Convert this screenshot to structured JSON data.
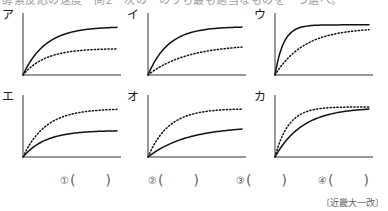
{
  "header": {
    "clipped_text": "酵素反応の速度　問2　次の　のうち最も適当なものを一つ選べ。"
  },
  "panels": [
    {
      "label": "ア",
      "curves": [
        {
          "style": "solid",
          "plateau": 0.82,
          "rate": 4.2
        },
        {
          "style": "dotted",
          "plateau": 0.45,
          "rate": 4.2
        }
      ]
    },
    {
      "label": "イ",
      "curves": [
        {
          "style": "solid",
          "plateau": 0.82,
          "rate": 4.6
        },
        {
          "style": "dotted",
          "plateau": 0.52,
          "rate": 2.4
        }
      ]
    },
    {
      "label": "ウ",
      "curves": [
        {
          "style": "solid",
          "plateau": 0.85,
          "rate": 11.0
        },
        {
          "style": "dotted",
          "plateau": 0.8,
          "rate": 3.2
        }
      ]
    },
    {
      "label": "エ",
      "curves": [
        {
          "style": "dotted",
          "plateau": 0.82,
          "rate": 4.2
        },
        {
          "style": "solid",
          "plateau": 0.45,
          "rate": 4.2
        }
      ]
    },
    {
      "label": "オ",
      "curves": [
        {
          "style": "dotted",
          "plateau": 0.82,
          "rate": 4.6
        },
        {
          "style": "solid",
          "plateau": 0.52,
          "rate": 2.4
        }
      ]
    },
    {
      "label": "カ",
      "curves": [
        {
          "style": "dotted",
          "plateau": 0.85,
          "rate": 7.0
        },
        {
          "style": "solid",
          "plateau": 0.84,
          "rate": 3.4
        }
      ]
    }
  ],
  "answers": [
    {
      "number": "①",
      "open": "(",
      "value": "",
      "close": ")"
    },
    {
      "number": "②",
      "open": "(",
      "value": "",
      "close": ")"
    },
    {
      "number": "③",
      "open": "(",
      "value": "",
      "close": ")"
    },
    {
      "number": "④",
      "open": "(",
      "value": "",
      "close": ")"
    }
  ],
  "attribution": "〔近畿大一改〕",
  "chart_data": {
    "type": "line",
    "title": "",
    "xlabel": "",
    "ylabel": "",
    "grid": false,
    "legend": "none",
    "axis_ranges": {
      "xlim": [
        0,
        1
      ],
      "ylim": [
        0,
        1
      ]
    },
    "panel_count": 6,
    "note": "Six small saturation-curve plots (Michaelis-Menten style). Each panel shows one solid and one dotted curve rising from the origin to a plateau. No tick labels or gridlines are printed.",
    "panels": [
      {
        "label": "ア",
        "series": [
          {
            "name": "solid",
            "style": "solid",
            "plateau": 0.82,
            "rate": 4.2
          },
          {
            "name": "dotted",
            "style": "dotted",
            "plateau": 0.45,
            "rate": 4.2
          }
        ]
      },
      {
        "label": "イ",
        "series": [
          {
            "name": "solid",
            "style": "solid",
            "plateau": 0.82,
            "rate": 4.6
          },
          {
            "name": "dotted",
            "style": "dotted",
            "plateau": 0.52,
            "rate": 2.4
          }
        ]
      },
      {
        "label": "ウ",
        "series": [
          {
            "name": "solid",
            "style": "solid",
            "plateau": 0.85,
            "rate": 11.0
          },
          {
            "name": "dotted",
            "style": "dotted",
            "plateau": 0.8,
            "rate": 3.2
          }
        ]
      },
      {
        "label": "エ",
        "series": [
          {
            "name": "dotted",
            "style": "dotted",
            "plateau": 0.82,
            "rate": 4.2
          },
          {
            "name": "solid",
            "style": "solid",
            "plateau": 0.45,
            "rate": 4.2
          }
        ]
      },
      {
        "label": "オ",
        "series": [
          {
            "name": "dotted",
            "style": "dotted",
            "plateau": 0.82,
            "rate": 4.6
          },
          {
            "name": "solid",
            "style": "solid",
            "plateau": 0.52,
            "rate": 2.4
          }
        ]
      },
      {
        "label": "カ",
        "series": [
          {
            "name": "dotted",
            "style": "dotted",
            "plateau": 0.85,
            "rate": 7.0
          },
          {
            "name": "solid",
            "style": "solid",
            "plateau": 0.84,
            "rate": 3.4
          }
        ]
      }
    ]
  }
}
